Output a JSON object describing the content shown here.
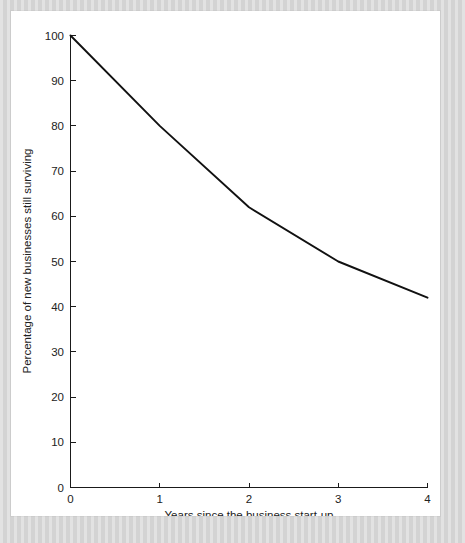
{
  "figure": {
    "background_color": "#d6d6d6",
    "panel_color": "#ffffff",
    "line_color": "#111111",
    "axis_color": "#1a1a1a"
  },
  "chart_data": {
    "type": "line",
    "title": "",
    "subtitle": "",
    "xlabel": "Years since the business start-up",
    "ylabel": "Percentage of new businesses still surviving",
    "x": [
      0,
      1,
      2,
      3,
      4
    ],
    "values": [
      100,
      80,
      62,
      50,
      42
    ],
    "series": [
      {
        "name": "Percentage of new businesses still surviving",
        "values": [
          100,
          80,
          62,
          50,
          42
        ]
      }
    ],
    "xlim": [
      0,
      4
    ],
    "ylim": [
      0,
      100
    ],
    "xticks": [
      0,
      1,
      2,
      3,
      4
    ],
    "yticks": [
      0,
      10,
      20,
      30,
      40,
      50,
      60,
      70,
      80,
      90,
      100
    ],
    "xtick_labels": [
      "0",
      "1",
      "2",
      "3",
      "4"
    ],
    "ytick_labels": [
      "0",
      "10",
      "20",
      "30",
      "40",
      "50",
      "60",
      "70",
      "80",
      "90",
      "100"
    ],
    "grid": false,
    "legend": false,
    "legend_position": "none",
    "annotations": []
  },
  "axes": {
    "y_tick_labels": [
      "100",
      "90",
      "80",
      "70",
      "60",
      "50",
      "40",
      "30",
      "20",
      "10",
      "0"
    ],
    "x_tick_labels": [
      "0",
      "1",
      "2",
      "3",
      "4"
    ],
    "x_axis_title": "Years since the business start-up",
    "y_axis_title": "Percentage of new businesses still surviving"
  }
}
